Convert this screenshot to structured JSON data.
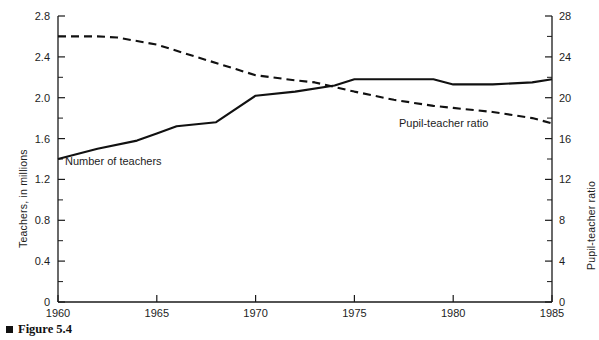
{
  "figure": {
    "caption": "Figure 5.4",
    "marker_icon": "filled-square-bullet"
  },
  "chart_data": {
    "type": "line",
    "title": "",
    "xlabel": "",
    "ylabel": "Teachers, in millions",
    "y2label": "Pupil-teacher ratio",
    "xlim": [
      1960,
      1985
    ],
    "ylim": [
      0,
      2.8
    ],
    "y2lim": [
      0,
      28
    ],
    "grid": false,
    "legend": "inline-annotations",
    "x_ticks": [
      1960,
      1965,
      1970,
      1975,
      1980,
      1985
    ],
    "x_tick_labels": [
      "1960",
      "1965",
      "1970",
      "1975",
      "1980",
      "1985"
    ],
    "y_ticks": [
      0,
      0.4,
      0.8,
      1.2,
      1.6,
      2.0,
      2.4,
      2.8
    ],
    "y_tick_labels": [
      "0",
      "0.4",
      "0.8",
      "1.2",
      "1.6",
      "2.0",
      "2.4",
      "2.8"
    ],
    "y_minor_ticks": [
      0.2,
      0.6,
      1.0,
      1.4,
      1.8,
      2.2,
      2.6
    ],
    "y2_ticks": [
      0,
      4,
      8,
      12,
      16,
      20,
      24,
      28
    ],
    "y2_tick_labels": [
      "0",
      "4",
      "8",
      "12",
      "16",
      "20",
      "24",
      "28"
    ],
    "y2_minor_ticks": [
      2,
      6,
      10,
      14,
      18,
      22,
      26
    ],
    "series": [
      {
        "name": "Number of teachers",
        "axis": "left",
        "style": "solid",
        "color": "#111111",
        "x": [
          1960,
          1962,
          1964,
          1965,
          1966,
          1968,
          1970,
          1972,
          1974,
          1975,
          1977,
          1979,
          1980,
          1982,
          1984,
          1985
        ],
        "values": [
          1.4,
          1.5,
          1.58,
          1.65,
          1.72,
          1.76,
          2.02,
          2.06,
          2.12,
          2.18,
          2.18,
          2.18,
          2.13,
          2.13,
          2.15,
          2.18
        ]
      },
      {
        "name": "Pupil-teacher ratio",
        "axis": "right",
        "style": "dashed",
        "color": "#111111",
        "x": [
          1960,
          1962,
          1963,
          1965,
          1967,
          1969,
          1970,
          1972,
          1973,
          1975,
          1977,
          1979,
          1980,
          1982,
          1984,
          1985
        ],
        "values": [
          26.0,
          26.0,
          25.9,
          25.2,
          24.0,
          22.8,
          22.2,
          21.7,
          21.5,
          20.6,
          19.8,
          19.2,
          19.0,
          18.6,
          18.0,
          17.5
        ]
      }
    ],
    "annotations": [
      {
        "text": "Number of teachers",
        "series": "Number of teachers"
      },
      {
        "text": "Pupil-teacher ratio",
        "series": "Pupil-teacher ratio"
      }
    ]
  }
}
